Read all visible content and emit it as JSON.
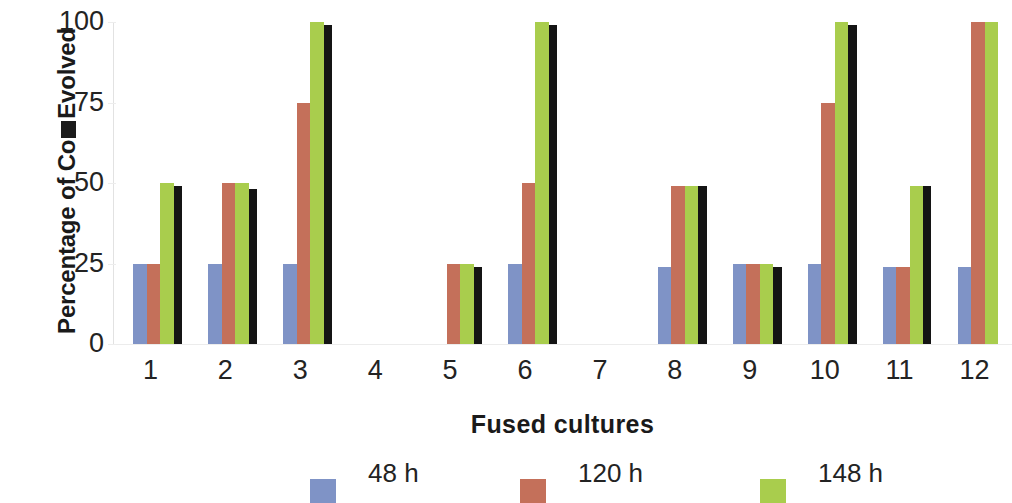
{
  "chart_data": {
    "type": "bar",
    "title": "",
    "xlabel": "Fused cultures",
    "ylabel": "Percentage of Co₂ Evolved",
    "ylabel_prefix": "Percentage of Co",
    "ylabel_suffix": "Evolved",
    "ylabel_subscript_glyph": "black-box",
    "ylim": [
      0,
      100
    ],
    "yticks": [
      0,
      25,
      50,
      75,
      100
    ],
    "ytick_labels": [
      "0",
      "25",
      "50",
      "75",
      "100"
    ],
    "grid": false,
    "legend_position": "bottom",
    "categories": [
      "1",
      "2",
      "3",
      "4",
      "5",
      "6",
      "7",
      "8",
      "9",
      "10",
      "11",
      "12"
    ],
    "series": [
      {
        "name": "48 h",
        "color": "#7f93c6",
        "values": [
          25,
          25,
          25,
          0,
          0,
          25,
          0,
          24,
          25,
          25,
          24,
          24
        ]
      },
      {
        "name": "120 h",
        "color": "#c4705a",
        "values": [
          25,
          50,
          75,
          0,
          25,
          50,
          0,
          49,
          25,
          75,
          24,
          100
        ]
      },
      {
        "name": "148 h",
        "color": "#a9cd4d",
        "values": [
          50,
          50,
          100,
          0,
          25,
          100,
          0,
          49,
          25,
          100,
          49,
          100
        ]
      },
      {
        "name": "",
        "color": "#141414",
        "values": [
          49,
          48,
          99,
          0,
          24,
          99,
          0,
          49,
          24,
          99,
          49,
          0
        ]
      }
    ]
  },
  "legend": {
    "items": [
      {
        "label": "48 h",
        "color": "#7f93c6"
      },
      {
        "label": "120 h",
        "color": "#c4705a"
      },
      {
        "label": "148 h",
        "color": "#a9cd4d"
      }
    ]
  }
}
